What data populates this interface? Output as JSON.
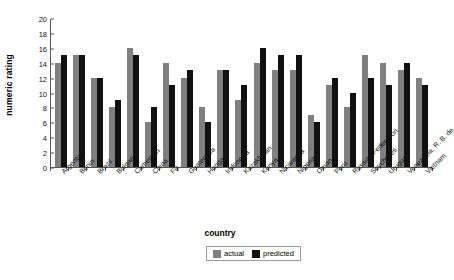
{
  "chart_data": {
    "type": "bar",
    "title": "",
    "xlabel": "country",
    "ylabel": "numeric rating",
    "ylim": [
      0,
      20
    ],
    "yticks": [
      0,
      2,
      4,
      6,
      8,
      10,
      12,
      14,
      16,
      18,
      20
    ],
    "grid": false,
    "legend_position": "bottom-center",
    "categories": [
      "Argentina",
      "Benin",
      "Brazil",
      "Bulgaria",
      "Cameroon",
      "China",
      "Fiji",
      "Guatemala",
      "Hungary",
      "Indonesia",
      "Kazakhstan",
      "Kenya",
      "Nicaragua",
      "Nigeria",
      "Oman",
      "Peru",
      "Russian Federation",
      "Seychelles",
      "Uruguay",
      "Venezuela, R. B. de",
      "Vietnam"
    ],
    "series": [
      {
        "name": "actual",
        "color": "#808080",
        "values": [
          14,
          15,
          12,
          8,
          16,
          6,
          14,
          12,
          8,
          13,
          9,
          14,
          13,
          13,
          7,
          11,
          8,
          15,
          14,
          13,
          12
        ]
      },
      {
        "name": "predicted",
        "color": "#111111",
        "values": [
          15,
          15,
          12,
          9,
          15,
          8,
          11,
          13,
          6,
          13,
          11,
          16,
          15,
          15,
          6,
          12,
          10,
          12,
          11,
          14,
          11
        ]
      }
    ]
  },
  "legend": {
    "items": [
      {
        "label": "actual",
        "color": "#808080"
      },
      {
        "label": "predicted",
        "color": "#111111"
      }
    ]
  }
}
